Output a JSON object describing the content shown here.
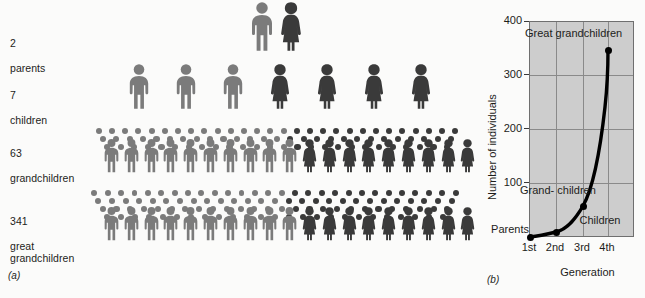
{
  "figure": {
    "panel_a": {
      "caption": "(a)",
      "rows": [
        {
          "count": "2",
          "label": "parents",
          "males": 1,
          "females": 1
        },
        {
          "count": "7",
          "label": "children",
          "males": 3,
          "females": 4
        },
        {
          "count": "63",
          "label": "grandchildren",
          "males": 8,
          "females": 7
        },
        {
          "count": "341",
          "label": "great\ngrandchildren",
          "males": 9,
          "females": 8
        }
      ]
    },
    "panel_b": {
      "caption": "(b)"
    }
  },
  "chart_data": {
    "type": "line",
    "title": "",
    "xlabel": "Generation",
    "ylabel": "Number of individuals",
    "x": [
      "1st",
      "2nd",
      "3rd",
      "4th"
    ],
    "xtick_labels": [
      "1st",
      "2nd",
      "3rd",
      "4th"
    ],
    "values": [
      2,
      7,
      63,
      341
    ],
    "ytick_labels": [
      "400",
      "300",
      "200",
      "100"
    ],
    "ytick_values": [
      400,
      300,
      200,
      100
    ],
    "ylim": [
      0,
      400
    ],
    "grid": true,
    "legend": "none",
    "annotations": [
      {
        "name": "parents",
        "text": "Parents",
        "value": 2
      },
      {
        "name": "children",
        "text": "Children",
        "value": 7
      },
      {
        "name": "grandchildren",
        "text": "Grand-\nchildren",
        "value": 63
      },
      {
        "name": "great-grandchildren",
        "text": "Great\ngrandchildren",
        "value": 341
      }
    ]
  },
  "colors": {
    "male_figure": "#7b7b7b",
    "female_figure": "#3a3a3a",
    "plot_background": "#cdcdcd",
    "gridline": "#8a8a8a",
    "curve": "#000000",
    "text": "#1d1d1b"
  }
}
